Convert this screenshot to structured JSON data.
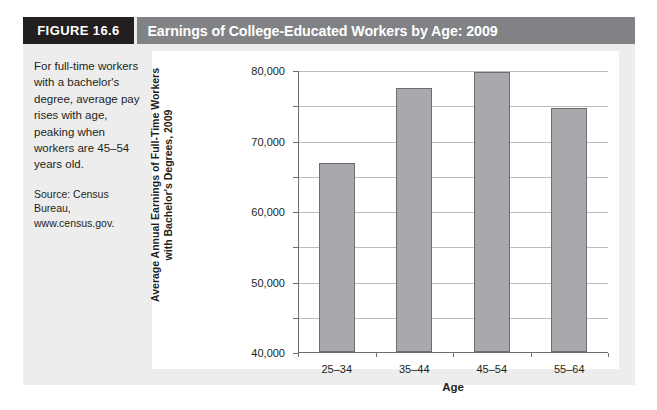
{
  "figure": {
    "number_label": "FIGURE 16.6",
    "title": "Earnings of College-Educated Workers by Age: 2009",
    "caption": "For full-time workers with a bachelor's degree, average pay rises with age, peaking when workers are 45–54 years old.",
    "source": "Source: Census Bureau, www.census.gov."
  },
  "colors": {
    "figure_number_bg": "#231f20",
    "title_bar_bg": "#808285",
    "title_text": "#ffffff",
    "figure_body_bg": "#ededed",
    "chart_panel_bg": "#ffffff",
    "bar_fill": "#a7a9ac",
    "bar_stroke": "#6d6e71",
    "gridline": "#bcbcbc",
    "axis_line": "#6d6e71",
    "text": "#231f20"
  },
  "chart_data": {
    "type": "bar",
    "title": "Earnings of College-Educated Workers by Age: 2009",
    "categories": [
      "25–34",
      "35–44",
      "45–54",
      "55–64"
    ],
    "values": [
      53500,
      74800,
      79500,
      69200
    ],
    "xlabel": "Age",
    "ylabel": "Average Annual Earnings of Full-Time Workers with Bachelor's Degrees, 2009",
    "ylabel_lines": [
      "Average Annual Earnings of Full-Time Workers",
      "with Bachelor's Degrees, 2009"
    ],
    "ylim": [
      0,
      80000
    ],
    "ytick_values": [
      0,
      10000,
      20000,
      30000,
      40000,
      50000,
      60000,
      70000,
      80000
    ],
    "ytick_labels": [
      "0",
      "10,000",
      "20,000",
      "30,000",
      "40,000",
      "50,000",
      "60,000",
      "70,000",
      "80,000"
    ],
    "grid": true,
    "legend": false
  }
}
